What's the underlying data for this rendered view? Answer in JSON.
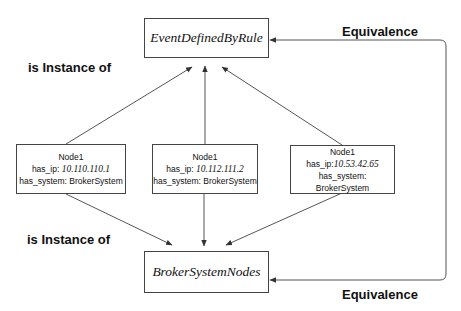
{
  "diagram": {
    "classes": {
      "top": {
        "label": "EventDefinedByRule"
      },
      "bottom": {
        "label": "BrokerSystemNodes"
      }
    },
    "nodes": [
      {
        "name": "Node1",
        "ip_key": "has_ip: ",
        "ip_value": "10.110.110.1",
        "system": "has_system: BrokerSystem"
      },
      {
        "name": "Node1",
        "ip_key": "has_ip: ",
        "ip_value": "10.112.111.2",
        "system": "has_system: BrokerSystem"
      },
      {
        "name": "Node1",
        "ip_key": "has_ip:",
        "ip_value": "10.53.42.65",
        "system": "has_system: BrokerSystem"
      }
    ],
    "labels": {
      "instance_top": "is Instance of",
      "instance_bottom": "is Instance of",
      "equivalence_top": "Equivalence",
      "equivalence_bottom": "Equivalence"
    },
    "colors": {
      "line": "#444444",
      "text": "#111111",
      "background": "#ffffff"
    }
  }
}
